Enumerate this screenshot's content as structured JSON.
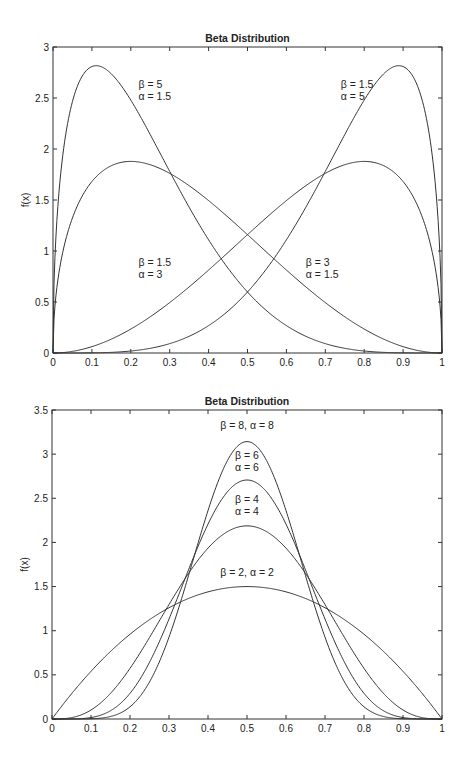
{
  "chart_data": [
    {
      "type": "line",
      "title": "Beta Distribution",
      "xlabel": "",
      "ylabel": "f(x)",
      "xlim": [
        0,
        1
      ],
      "ylim": [
        0,
        3
      ],
      "grid": false,
      "x_ticks": [
        "0",
        "0.1",
        "0.2",
        "0.3",
        "0.4",
        "0.5",
        "0.6",
        "0.7",
        "0.8",
        "0.9",
        "1"
      ],
      "y_ticks": [
        "0",
        "0.5",
        "1",
        "1.5",
        "2",
        "2.5",
        "3"
      ],
      "box": {
        "left": 53,
        "top": 47,
        "right": 442,
        "bottom": 353
      },
      "series": [
        {
          "name": "β = 5, α = 1.5",
          "a": 1.5,
          "b": 5,
          "peak": {
            "x": 0.11,
            "y": 2.8
          }
        },
        {
          "name": "β = 1.5, α = 3",
          "a": 1.5,
          "b": 3,
          "peak": {
            "x": 0.2,
            "y": 1.87
          }
        },
        {
          "name": "β = 3, α = 1.5",
          "a": 3,
          "b": 1.5,
          "peak": {
            "x": 0.8,
            "y": 1.87
          }
        },
        {
          "name": "β = 1.5, α = 5",
          "a": 5,
          "b": 1.5,
          "peak": {
            "x": 0.89,
            "y": 2.8
          }
        }
      ],
      "annotations": [
        {
          "lines": [
            "β = 5",
            "α = 1.5"
          ],
          "x": 0.22,
          "y": 2.6
        },
        {
          "lines": [
            "β = 1.5",
            "α = 5"
          ],
          "x": 0.74,
          "y": 2.6
        },
        {
          "lines": [
            "β = 1.5",
            "α = 3"
          ],
          "x": 0.22,
          "y": 0.85
        },
        {
          "lines": [
            "β = 3",
            "α = 1.5"
          ],
          "x": 0.65,
          "y": 0.85
        }
      ]
    },
    {
      "type": "line",
      "title": "Beta Distribution",
      "xlabel": "",
      "ylabel": "f(x)",
      "xlim": [
        0,
        1
      ],
      "ylim": [
        0,
        3.5
      ],
      "grid": false,
      "x_ticks": [
        "0",
        "0.1",
        "0.2",
        "0.3",
        "0.4",
        "0.5",
        "0.6",
        "0.7",
        "0.8",
        "0.9",
        "1"
      ],
      "y_ticks": [
        "0",
        "0.5",
        "1",
        "1.5",
        "2",
        "2.5",
        "3",
        "3.5"
      ],
      "box": {
        "left": 52,
        "top": 410,
        "right": 442,
        "bottom": 719
      },
      "series": [
        {
          "name": "β = 8, α = 8",
          "a": 8,
          "b": 8,
          "peak": {
            "x": 0.5,
            "y": 3.14
          }
        },
        {
          "name": "β = 6, α = 6",
          "a": 6,
          "b": 6,
          "peak": {
            "x": 0.5,
            "y": 2.71
          }
        },
        {
          "name": "β = 4, α = 4",
          "a": 4,
          "b": 4,
          "peak": {
            "x": 0.5,
            "y": 2.19
          }
        },
        {
          "name": "β = 2, α = 2",
          "a": 2,
          "b": 2,
          "peak": {
            "x": 0.5,
            "y": 1.5
          }
        }
      ],
      "annotations": [
        {
          "lines": [
            "β = 8, α =  8"
          ],
          "x": 0.5,
          "y": 3.28
        },
        {
          "lines": [
            "β = 6",
            "α = 6"
          ],
          "x": 0.5,
          "y": 2.95
        },
        {
          "lines": [
            "β = 4",
            "α = 4"
          ],
          "x": 0.5,
          "y": 2.45
        },
        {
          "lines": [
            "β = 2, α = 2"
          ],
          "x": 0.5,
          "y": 1.62
        }
      ]
    }
  ]
}
